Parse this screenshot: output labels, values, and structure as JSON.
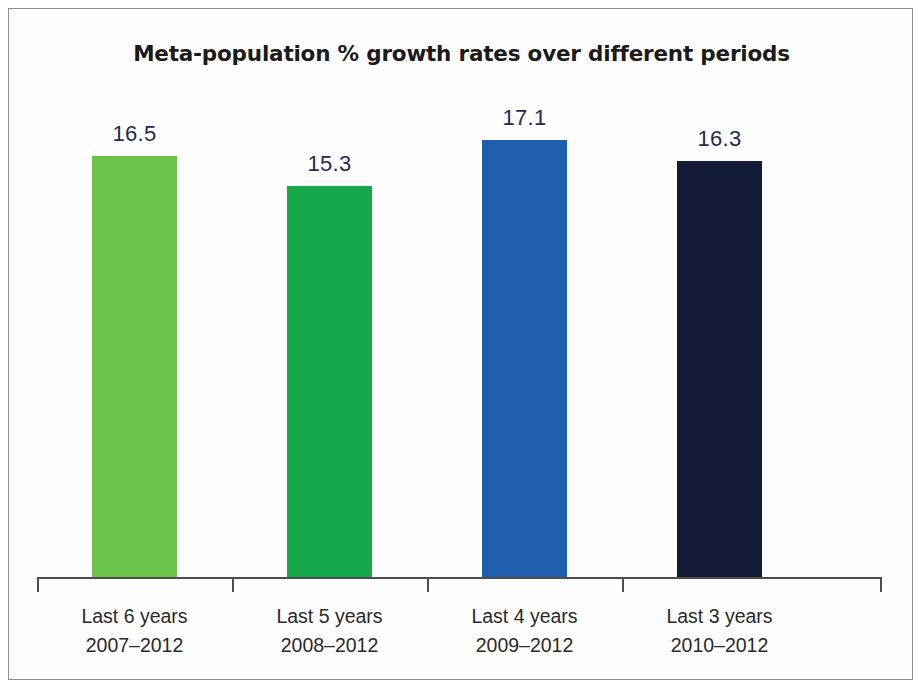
{
  "chart_data": {
    "type": "bar",
    "title": "Meta-population % growth rates over different periods",
    "subtitle": "",
    "xlabel": "",
    "ylabel": "",
    "grid": false,
    "legend": "none",
    "ylim": [
      0,
      18
    ],
    "axis_visible": {
      "x": true,
      "y": false
    },
    "categories": [
      "Last 6 years\n2007–2012",
      "Last 5 years\n2008–2012",
      "Last 4 years\n2009–2012",
      "Last 3 years\n2010–2012"
    ],
    "category_lines": [
      {
        "line1": "Last 6 years",
        "line2": "2007–2012"
      },
      {
        "line1": "Last 5 years",
        "line2": "2008–2012"
      },
      {
        "line1": "Last 4 years",
        "line2": "2009–2012"
      },
      {
        "line1": "Last 3 years",
        "line2": "2010–2012"
      }
    ],
    "values": [
      16.5,
      15.3,
      17.1,
      16.3
    ],
    "value_labels": [
      "16.5",
      "15.3",
      "17.1",
      "16.3"
    ],
    "bar_colors": [
      "#6cc24a",
      "#16a84b",
      "#1f5fad",
      "#131a38"
    ],
    "units": "percent"
  },
  "colors": {
    "title_text": "#1b1b1b",
    "value_label_text": "#232a55",
    "category_label_text": "#2a2a2a",
    "axis_line": "#4d4d4d",
    "frame_border": "#8e8e90",
    "background": "#ffffff"
  }
}
